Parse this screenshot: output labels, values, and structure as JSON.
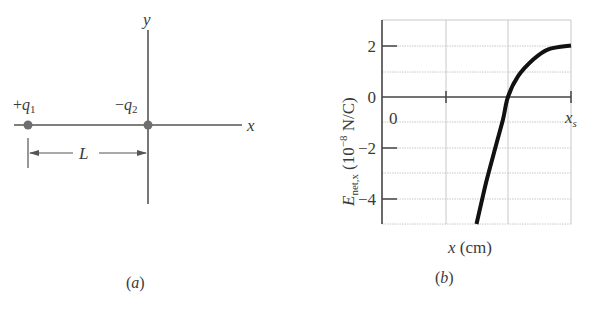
{
  "panel_a": {
    "caption": "(a)",
    "x_axis_label": "x",
    "y_axis_label": "y",
    "charges": [
      {
        "sign": "+",
        "name": "q",
        "sub": "1",
        "label": "+q1"
      },
      {
        "sign": "−",
        "name": "q",
        "sub": "2",
        "label": "−q2"
      }
    ],
    "separation_label": "L",
    "colors": {
      "axis": "#555555",
      "charge": "#6e6e6e"
    }
  },
  "panel_b": {
    "caption": "(b)"
  },
  "chart_data": {
    "type": "line",
    "title": "",
    "xlabel": "x (cm)",
    "ylabel": "E_net,x (10^-8 N/C)",
    "ylabel_parts": {
      "main": "E",
      "sub": "net,x",
      "unit_prefix": "(10",
      "exp": "−8",
      "unit_suffix": " N/C)"
    },
    "ylim": [
      -5,
      3
    ],
    "yticks": [
      2,
      0,
      -2,
      -4
    ],
    "ytick_labels": [
      "2",
      "0",
      "−2",
      "−4"
    ],
    "xlim": [
      0,
      "x_s"
    ],
    "xtick_labels": [
      {
        "text": "0",
        "pos": 0
      },
      {
        "text": "x",
        "sub": "s",
        "pos": 1
      }
    ],
    "x_gridlines_fraction": [
      0,
      0.333,
      0.667,
      1
    ],
    "y_gridlines": [
      3,
      2,
      1,
      0,
      -1,
      -2,
      -3,
      -4,
      -5
    ],
    "grid": true,
    "series": [
      {
        "name": "E_net,x",
        "x_fraction": [
          0.5,
          0.55,
          0.6,
          0.64,
          0.667,
          0.72,
          0.8,
          0.88,
          1.0
        ],
        "values": [
          -5.0,
          -3.4,
          -2.0,
          -0.9,
          0.0,
          0.8,
          1.45,
          1.85,
          2.0
        ]
      }
    ],
    "annotations": [
      "Curve crosses zero at x ≈ 2/3 x_s",
      "Approaches 2 × 10^-8 N/C at x_s"
    ]
  }
}
